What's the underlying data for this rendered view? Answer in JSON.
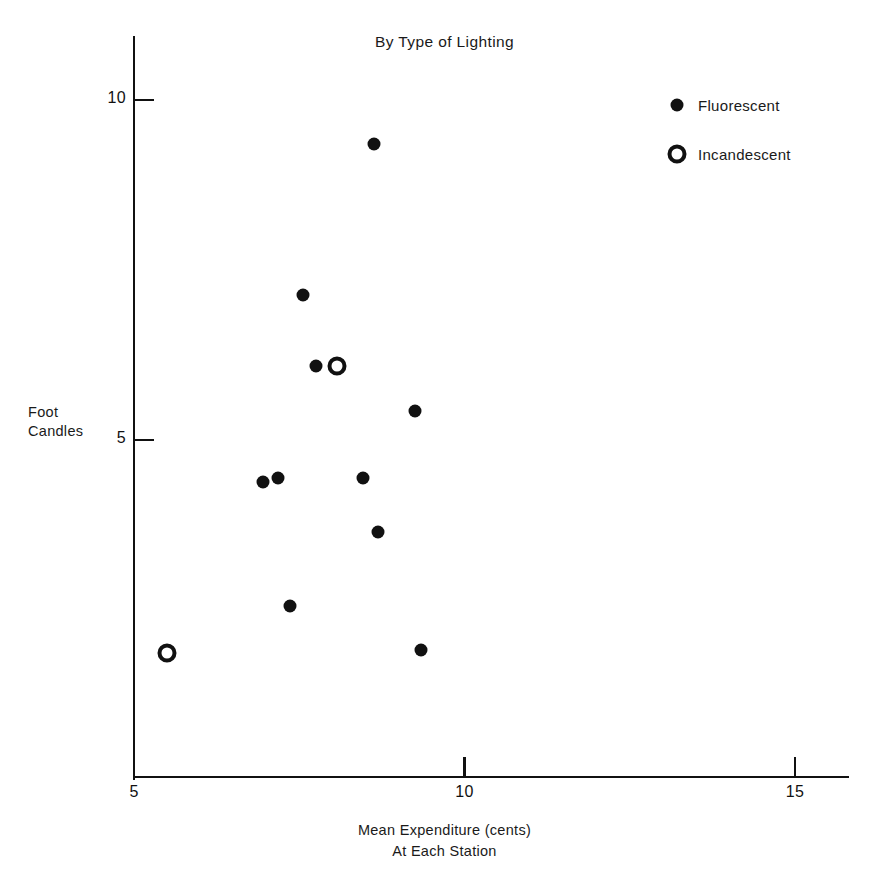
{
  "chart_data": {
    "type": "scatter",
    "title": "By Type of Lighting",
    "xlabel": "Mean Expenditure (cents)",
    "xlabel_line2": "At Each Station",
    "ylabel_line1": "Foot",
    "ylabel_line2": "Candles",
    "xlim": [
      5,
      15.8
    ],
    "ylim": [
      0.55,
      10.5
    ],
    "xticks": [
      5,
      10,
      15
    ],
    "xtick_labels": [
      "5",
      "10",
      "15"
    ],
    "yticks": [
      5,
      10
    ],
    "ytick_labels": [
      "5",
      "10"
    ],
    "grid": false,
    "legend_position": "upper right",
    "marker_color": "#111111",
    "series": [
      {
        "name": "Fluorescent",
        "marker": "filled-circle",
        "points": [
          {
            "x": 8.63,
            "y": 9.35
          },
          {
            "x": 7.56,
            "y": 7.13
          },
          {
            "x": 7.75,
            "y": 6.09
          },
          {
            "x": 9.25,
            "y": 5.43
          },
          {
            "x": 6.95,
            "y": 4.38
          },
          {
            "x": 7.18,
            "y": 4.44
          },
          {
            "x": 8.46,
            "y": 4.44
          },
          {
            "x": 8.69,
            "y": 3.65
          },
          {
            "x": 7.36,
            "y": 2.56
          },
          {
            "x": 9.34,
            "y": 1.91
          }
        ]
      },
      {
        "name": "Incandescent",
        "marker": "open-circle",
        "points": [
          {
            "x": 8.07,
            "y": 6.09
          },
          {
            "x": 5.5,
            "y": 1.87
          }
        ]
      }
    ]
  },
  "legend": {
    "items": [
      {
        "label": "Fluorescent",
        "marker": "filled-circle"
      },
      {
        "label": "Incandescent",
        "marker": "open-circle"
      }
    ]
  }
}
